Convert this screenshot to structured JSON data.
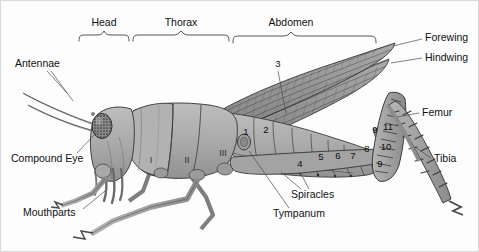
{
  "figure": {
    "view": "lateral"
  },
  "body_regions": [
    {
      "id": "head",
      "label": "Head",
      "bracket_x1": 78,
      "bracket_x2": 128,
      "label_x": 103,
      "label_y": 22
    },
    {
      "id": "thorax",
      "label": "Thorax",
      "bracket_x1": 132,
      "bracket_x2": 228,
      "label_x": 180,
      "label_y": 22
    },
    {
      "id": "abdomen",
      "label": "Abdomen",
      "bracket_x1": 232,
      "bracket_x2": 375,
      "label_x": 290,
      "label_y": 22
    }
  ],
  "callouts": [
    {
      "id": "antennae",
      "label": "Antennae",
      "x": 14,
      "y": 63,
      "anchor": "start"
    },
    {
      "id": "compound-eye",
      "label": "Compound Eye",
      "x": 10,
      "y": 158,
      "anchor": "start"
    },
    {
      "id": "mouthparts",
      "label": "Mouthparts",
      "x": 22,
      "y": 212,
      "anchor": "start"
    },
    {
      "id": "forewing",
      "label": "Forewing",
      "x": 424,
      "y": 37,
      "anchor": "start"
    },
    {
      "id": "hindwing",
      "label": "Hindwing",
      "x": 424,
      "y": 57,
      "anchor": "start"
    },
    {
      "id": "femur",
      "label": "Femur",
      "x": 421,
      "y": 112,
      "anchor": "start"
    },
    {
      "id": "tibia",
      "label": "Tibia",
      "x": 433,
      "y": 158,
      "anchor": "start"
    },
    {
      "id": "spiracles",
      "label": "Spiracles",
      "x": 290,
      "y": 194,
      "anchor": "start"
    },
    {
      "id": "tympanum",
      "label": "Tympanum",
      "x": 272,
      "y": 213,
      "anchor": "start"
    }
  ],
  "thorax_segments": [
    {
      "numeral": "I",
      "x": 150,
      "y": 160
    },
    {
      "numeral": "II",
      "x": 186,
      "y": 160
    },
    {
      "numeral": "III",
      "x": 222,
      "y": 153
    }
  ],
  "abdomen_segments": [
    {
      "number": "1",
      "x": 245,
      "y": 131
    },
    {
      "number": "2",
      "x": 265,
      "y": 129
    },
    {
      "number": "3",
      "x": 277,
      "y": 63
    },
    {
      "number": "4",
      "x": 299,
      "y": 163
    },
    {
      "number": "5",
      "x": 320,
      "y": 156
    },
    {
      "number": "6",
      "x": 337,
      "y": 155
    },
    {
      "number": "7",
      "x": 352,
      "y": 155
    },
    {
      "number": "8",
      "x": 366,
      "y": 148
    },
    {
      "number": "9",
      "x": 374,
      "y": 129
    },
    {
      "number": "10",
      "x": 384,
      "y": 146
    },
    {
      "number": "11",
      "x": 386,
      "y": 126
    },
    {
      "number": "9",
      "x": 379,
      "y": 163
    }
  ],
  "colors": {
    "background": "#fdfdfd",
    "body_fill": "#a8a8a8",
    "body_fill_light": "#bcbcbc",
    "body_fill_dark": "#8e8e8e",
    "wing_fill": "#9a9a9a",
    "wing_fill_dark": "#7d7d7d",
    "eye_fill": "#6d6d6d",
    "outline": "#3a3a3a",
    "leader": "#4a4a4a",
    "text": "#111111"
  }
}
